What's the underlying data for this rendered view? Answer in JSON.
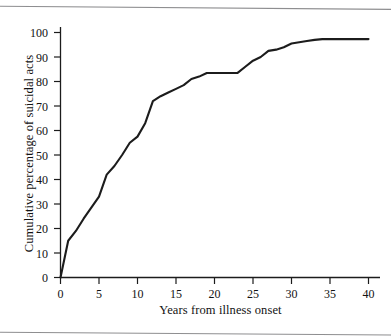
{
  "chart_data": {
    "type": "line",
    "title": "",
    "xlabel": "Years from illness onset",
    "ylabel": "Cumulative percentage of suicidal acts",
    "xlim": [
      0,
      40
    ],
    "ylim": [
      0,
      100
    ],
    "xticks": [
      "0",
      "5",
      "10",
      "15",
      "20",
      "25",
      "30",
      "35",
      "40"
    ],
    "yticks": [
      "0",
      "10",
      "20",
      "30",
      "40",
      "50",
      "60",
      "70",
      "80",
      "90",
      "100"
    ],
    "grid": false,
    "legend": null,
    "line_color": "#1c1c1c",
    "x": [
      0,
      1,
      2,
      3,
      4,
      5,
      6,
      7,
      8,
      9,
      10,
      11,
      12,
      13,
      14,
      15,
      16,
      17,
      18,
      19,
      20,
      21,
      22,
      23,
      24,
      25,
      26,
      27,
      28,
      29,
      30,
      31,
      32,
      33,
      34,
      35,
      36,
      37,
      38,
      39,
      40
    ],
    "values": [
      0,
      15,
      19,
      24,
      28.5,
      33,
      42,
      45.5,
      50,
      55,
      57.5,
      63,
      72,
      74,
      75.5,
      77,
      78.5,
      81,
      82,
      83.5,
      83.5,
      83.5,
      83.5,
      83.5,
      86,
      88.5,
      90,
      92.5,
      93,
      94,
      95.5,
      96,
      96.5,
      97,
      97.3,
      97.3,
      97.3,
      97.3,
      97.3,
      97.3,
      97.3
    ],
    "series": [
      {
        "name": "Cumulative percentage of suicidal acts",
        "values": [
          0,
          15,
          19,
          24,
          28.5,
          33,
          42,
          45.5,
          50,
          55,
          57.5,
          63,
          72,
          74,
          75.5,
          77,
          78.5,
          81,
          82,
          83.5,
          83.5,
          83.5,
          83.5,
          83.5,
          86,
          88.5,
          90,
          92.5,
          93,
          94,
          95.5,
          96,
          96.5,
          97,
          97.3,
          97.3,
          97.3,
          97.3,
          97.3,
          97.3,
          97.3
        ]
      }
    ]
  }
}
